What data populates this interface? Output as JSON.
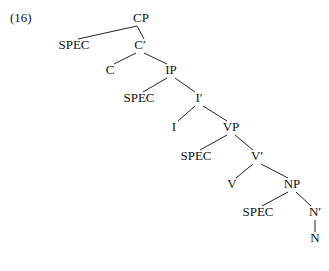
{
  "example_number": "(16)",
  "nodes": [
    {
      "id": "CP",
      "label": "CP",
      "x": 141,
      "y": 18
    },
    {
      "id": "SPEC1",
      "label": "SPEC",
      "x": 74,
      "y": 45
    },
    {
      "id": "C1",
      "label": "C′",
      "x": 140,
      "y": 45
    },
    {
      "id": "C",
      "label": "C",
      "x": 110,
      "y": 70
    },
    {
      "id": "IP",
      "label": "IP",
      "x": 171,
      "y": 70
    },
    {
      "id": "SPEC2",
      "label": "SPEC",
      "x": 139,
      "y": 98
    },
    {
      "id": "I1",
      "label": "I′",
      "x": 199,
      "y": 98
    },
    {
      "id": "I",
      "label": "I",
      "x": 174,
      "y": 127
    },
    {
      "id": "VP",
      "label": "VP",
      "x": 231,
      "y": 127
    },
    {
      "id": "SPEC3",
      "label": "SPEC",
      "x": 196,
      "y": 156
    },
    {
      "id": "V1",
      "label": "V′",
      "x": 257,
      "y": 156
    },
    {
      "id": "V",
      "label": "V",
      "x": 232,
      "y": 184
    },
    {
      "id": "NP",
      "label": "NP",
      "x": 292,
      "y": 184
    },
    {
      "id": "SPEC4",
      "label": "SPEC",
      "x": 258,
      "y": 212
    },
    {
      "id": "N1",
      "label": "N′",
      "x": 315,
      "y": 212
    },
    {
      "id": "N",
      "label": "N",
      "x": 315,
      "y": 238
    }
  ],
  "edges": [
    [
      "CP",
      "SPEC1"
    ],
    [
      "CP",
      "C1"
    ],
    [
      "C1",
      "C"
    ],
    [
      "C1",
      "IP"
    ],
    [
      "IP",
      "SPEC2"
    ],
    [
      "IP",
      "I1"
    ],
    [
      "I1",
      "I"
    ],
    [
      "I1",
      "VP"
    ],
    [
      "VP",
      "SPEC3"
    ],
    [
      "VP",
      "V1"
    ],
    [
      "V1",
      "V"
    ],
    [
      "V1",
      "NP"
    ],
    [
      "NP",
      "SPEC4"
    ],
    [
      "NP",
      "N1"
    ],
    [
      "N1",
      "N"
    ]
  ]
}
